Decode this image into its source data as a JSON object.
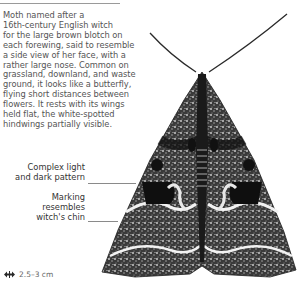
{
  "description": {
    "lines": [
      "Moth named after a",
      "16th-century English witch",
      "for the large brown blotch on",
      "each forewing, said to resemble",
      "a side view of her face, with a",
      "rather large nose. Common on",
      "grassland, downland, and waste",
      "ground, it looks like a butterfly,",
      "flying short distances between",
      "flowers. It rests with its wings",
      "held flat, the white-spotted",
      "hindwings partially visible."
    ]
  },
  "callouts": [
    {
      "lines": [
        "Complex light",
        "and dark pattern"
      ]
    },
    {
      "lines": [
        "Marking",
        "resembles",
        "witch's chin"
      ]
    }
  ],
  "size": {
    "icon": "wingspan-arrows-icon",
    "label": "2.5–3 cm"
  },
  "colors": {
    "text": "#555555",
    "leader": "#8a8a8a",
    "moth_dark": "#1c1c1c",
    "moth_light": "#e6e6e6"
  }
}
